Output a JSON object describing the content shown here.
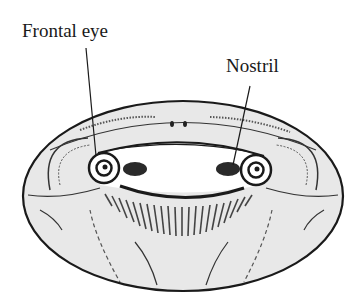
{
  "diagram": {
    "type": "anatomical-illustration",
    "labels": [
      {
        "id": "frontal-eye",
        "text": "Frontal eye"
      },
      {
        "id": "nostril",
        "text": "Nostril"
      }
    ],
    "colors": {
      "ink": "#1a1a1a",
      "fill": "#e9e9e9",
      "background": "#ffffff"
    }
  }
}
